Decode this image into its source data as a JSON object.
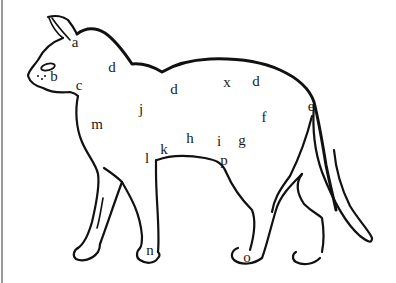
{
  "diagram": {
    "line_color": "#111111",
    "background": "#ffffff",
    "labels": [
      {
        "id": "a",
        "text": "a",
        "x": 75,
        "y": 42
      },
      {
        "id": "b",
        "text": "b",
        "x": 54,
        "y": 76
      },
      {
        "id": "c",
        "text": "c",
        "x": 79,
        "y": 85
      },
      {
        "id": "d1",
        "text": "d",
        "x": 112,
        "y": 67
      },
      {
        "id": "d2",
        "text": "d",
        "x": 174,
        "y": 89
      },
      {
        "id": "x",
        "text": "x",
        "x": 227,
        "y": 82
      },
      {
        "id": "d3",
        "text": "d",
        "x": 256,
        "y": 81
      },
      {
        "id": "e",
        "text": "e",
        "x": 311,
        "y": 106
      },
      {
        "id": "f",
        "text": "f",
        "x": 264,
        "y": 117
      },
      {
        "id": "g",
        "text": "g",
        "x": 242,
        "y": 140
      },
      {
        "id": "i",
        "text": "i",
        "x": 219,
        "y": 141
      },
      {
        "id": "h",
        "text": "h",
        "x": 190,
        "y": 138
      },
      {
        "id": "j",
        "text": "j",
        "x": 141,
        "y": 109
      },
      {
        "id": "k",
        "text": "k",
        "x": 164,
        "y": 149
      },
      {
        "id": "l",
        "text": "l",
        "x": 147,
        "y": 158
      },
      {
        "id": "m",
        "text": "m",
        "x": 97,
        "y": 124
      },
      {
        "id": "p",
        "text": "p",
        "x": 224,
        "y": 160
      },
      {
        "id": "n",
        "text": "n",
        "x": 150,
        "y": 250
      },
      {
        "id": "o",
        "text": "o",
        "x": 247,
        "y": 257
      }
    ]
  }
}
